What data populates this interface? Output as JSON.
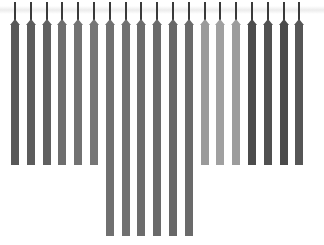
{
  "chart_data": {
    "type": "bar",
    "title": "",
    "xlabel": "",
    "ylabel": "",
    "grid": false,
    "legend": null,
    "orientation": "vertical-hanging",
    "categories": [
      "1",
      "2",
      "3",
      "4",
      "5",
      "6",
      "7",
      "8",
      "9",
      "10",
      "11",
      "12",
      "13",
      "14",
      "15",
      "16",
      "17",
      "18",
      "19"
    ],
    "series": [
      {
        "name": "bars",
        "top_y_px": 24,
        "bottom_y_px": [
          165,
          165,
          165,
          165,
          165,
          165,
          236,
          236,
          236,
          236,
          236,
          236,
          165,
          165,
          165,
          165,
          165,
          165,
          165
        ],
        "colors": [
          "#585858",
          "#5c5c5c",
          "#606060",
          "#6e6e6e",
          "#727272",
          "#767676",
          "#707070",
          "#707070",
          "#6c6c6c",
          "#6a6a6a",
          "#686868",
          "#6a6a6a",
          "#9a9a9a",
          "#a0a0a0",
          "#9c9c9c",
          "#4c4c4c",
          "#505050",
          "#4a4a4a",
          "#565656"
        ]
      }
    ],
    "caption_visible_fragment": "(clipped, illegible)"
  },
  "layout": {
    "x_start": 15,
    "spacing": 15.8,
    "bar_width": 8,
    "stem_top": 2,
    "bar_top": 24
  }
}
